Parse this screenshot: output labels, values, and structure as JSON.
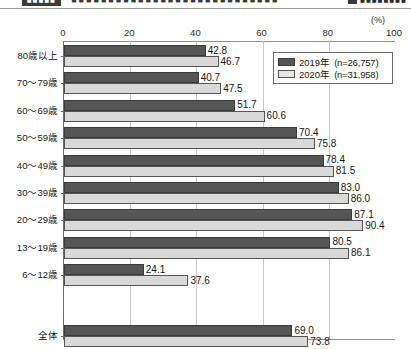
{
  "cropped_header": {
    "chip_label": "■■■■■",
    "text": "■■■■■■■■■■■■■■■■■■■■■■■■■■■■",
    "side_text": "■■■■■■■■"
  },
  "chart_data": {
    "type": "bar",
    "orientation": "horizontal",
    "title": "",
    "xlabel": "",
    "ylabel": "",
    "unit_label": "(%)",
    "xlim": [
      0,
      100
    ],
    "xticks": [
      0,
      20,
      40,
      60,
      80,
      100
    ],
    "xtick_labels": [
      "0",
      "20",
      "40",
      "60",
      "80",
      "100"
    ],
    "grid": true,
    "grid_axis": "x",
    "legend_position": "top-right",
    "categories": [
      "80歳以上",
      "70〜79歳",
      "60〜69歳",
      "50〜59歳",
      "40〜49歳",
      "30〜39歳",
      "20〜29歳",
      "13〜19歳",
      "6〜12歳",
      "全体"
    ],
    "series": [
      {
        "name": "2019年",
        "legend_label": "2019年",
        "n_label": "(n=26,757)",
        "color": "#565656",
        "values": [
          42.8,
          40.7,
          51.7,
          70.4,
          78.4,
          83.0,
          87.1,
          80.5,
          24.1,
          69.0
        ],
        "value_labels": [
          "42.8",
          "40.7",
          "51.7",
          "70.4",
          "78.4",
          "83.0",
          "87.1",
          "80.5",
          "24.1",
          "69.0"
        ]
      },
      {
        "name": "2020年",
        "legend_label": "2020年",
        "n_label": "(n=31,958)",
        "color": "#d9d9d9",
        "values": [
          46.7,
          47.5,
          60.6,
          75.8,
          81.5,
          86.0,
          90.4,
          86.1,
          37.6,
          73.8
        ],
        "value_labels": [
          "46.7",
          "47.5",
          "60.6",
          "75.8",
          "81.5",
          "86.0",
          "90.4",
          "86.1",
          "37.6",
          "73.8"
        ]
      }
    ]
  }
}
